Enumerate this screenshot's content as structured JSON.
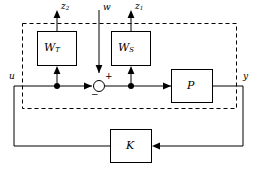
{
  "diagram": {
    "stroke_color": "#000000",
    "background_color": "#ffffff",
    "boundary_style": "dashed"
  },
  "blocks": {
    "weight_t": {
      "label_base": "W",
      "label_sub": "T",
      "name": "W_T"
    },
    "weight_s": {
      "label_base": "W",
      "label_sub": "S",
      "name": "W_S"
    },
    "plant": {
      "label": "P",
      "name": "P"
    },
    "controller": {
      "label": "K",
      "name": "K"
    }
  },
  "signals": {
    "z2": {
      "label_base": "z",
      "label_sub": "2"
    },
    "w": {
      "label": "w"
    },
    "z1": {
      "label_base": "z",
      "label_sub": "1"
    },
    "u": {
      "label": "u"
    },
    "y": {
      "label": "y"
    }
  },
  "summing_junction": {
    "plus_label": "+",
    "minus_label": "−"
  }
}
